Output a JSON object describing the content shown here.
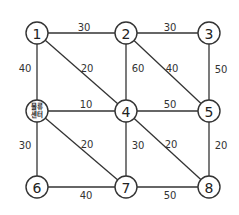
{
  "diagram": {
    "type": "weighted-graph",
    "nodes": [
      {
        "id": "1",
        "label": "1",
        "x": 37,
        "y": 33
      },
      {
        "id": "2",
        "label": "2",
        "x": 126,
        "y": 33
      },
      {
        "id": "3",
        "label": "3",
        "x": 209,
        "y": 33
      },
      {
        "id": "C",
        "label": "물류센터",
        "line1": "물류",
        "line2": "센터",
        "x": 37,
        "y": 111
      },
      {
        "id": "4",
        "label": "4",
        "x": 126,
        "y": 111
      },
      {
        "id": "5",
        "label": "5",
        "x": 209,
        "y": 111
      },
      {
        "id": "6",
        "label": "6",
        "x": 37,
        "y": 187
      },
      {
        "id": "7",
        "label": "7",
        "x": 126,
        "y": 187
      },
      {
        "id": "8",
        "label": "8",
        "x": 209,
        "y": 187
      }
    ],
    "edges": [
      {
        "from": "1",
        "to": "2",
        "weight": "30",
        "lx": 84,
        "ly": 27
      },
      {
        "from": "2",
        "to": "3",
        "weight": "30",
        "lx": 170,
        "ly": 27
      },
      {
        "from": "1",
        "to": "C",
        "weight": "40",
        "lx": 25,
        "ly": 68
      },
      {
        "from": "1",
        "to": "4",
        "weight": "20",
        "lx": 87,
        "ly": 68
      },
      {
        "from": "2",
        "to": "4",
        "weight": "60",
        "lx": 138,
        "ly": 68
      },
      {
        "from": "2",
        "to": "5",
        "weight": "40",
        "lx": 172,
        "ly": 68
      },
      {
        "from": "3",
        "to": "5",
        "weight": "50",
        "lx": 221,
        "ly": 69
      },
      {
        "from": "C",
        "to": "4",
        "weight": "10",
        "lx": 86,
        "ly": 104
      },
      {
        "from": "4",
        "to": "5",
        "weight": "50",
        "lx": 170,
        "ly": 104
      },
      {
        "from": "C",
        "to": "6",
        "weight": "30",
        "lx": 25,
        "ly": 145
      },
      {
        "from": "C",
        "to": "7",
        "weight": "20",
        "lx": 87,
        "ly": 144
      },
      {
        "from": "4",
        "to": "7",
        "weight": "30",
        "lx": 138,
        "ly": 145
      },
      {
        "from": "4",
        "to": "8",
        "weight": "20",
        "lx": 171,
        "ly": 144
      },
      {
        "from": "5",
        "to": "8",
        "weight": "20",
        "lx": 221,
        "ly": 145
      },
      {
        "from": "6",
        "to": "7",
        "weight": "40",
        "lx": 86,
        "ly": 195
      },
      {
        "from": "7",
        "to": "8",
        "weight": "50",
        "lx": 170,
        "ly": 195
      }
    ],
    "node_radius": 11
  }
}
